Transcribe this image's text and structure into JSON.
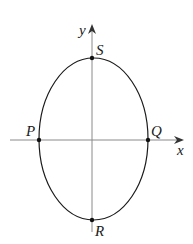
{
  "diagram": {
    "type": "ellipse-on-axes",
    "axes": {
      "x_label": "x",
      "y_label": "y",
      "color": "#808080"
    },
    "curve": {
      "shape": "ellipse",
      "color": "#1a1a1a"
    },
    "points": [
      {
        "id": "S",
        "label": "S",
        "position": "top of ellipse on y-axis"
      },
      {
        "id": "P",
        "label": "P",
        "position": "left intersection with x-axis"
      },
      {
        "id": "Q",
        "label": "Q",
        "position": "right intersection with x-axis"
      },
      {
        "id": "R",
        "label": "R",
        "position": "bottom of ellipse on y-axis"
      }
    ]
  }
}
